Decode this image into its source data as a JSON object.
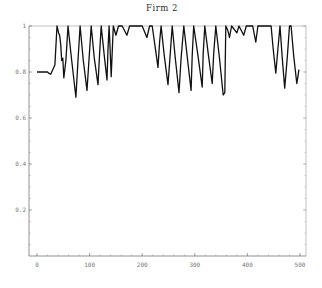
{
  "chart_data": {
    "type": "line",
    "title": "Firm 2",
    "xlabel": "",
    "ylabel": "",
    "xlim": [
      0,
      500
    ],
    "ylim": [
      0,
      1
    ],
    "x_ticks": [
      0,
      100,
      200,
      300,
      400,
      500
    ],
    "x_tick_labels": [
      "0",
      "100",
      "200",
      "300",
      "400",
      "500"
    ],
    "y_ticks": [
      0.2,
      0.4,
      0.6,
      0.8,
      1
    ],
    "y_tick_labels": [
      "0.2",
      "0.4",
      "0.6",
      "0.8",
      "1"
    ],
    "grid": false,
    "legend": null,
    "series": [
      {
        "name": "Firm 2",
        "color": "#111111",
        "x": [
          0,
          20,
          22,
          26,
          34,
          38,
          41,
          43,
          45,
          47,
          49,
          51,
          55,
          59,
          66,
          74,
          78,
          82,
          88,
          95,
          99,
          103,
          109,
          116,
          119,
          122,
          128,
          133,
          135,
          137,
          139,
          141,
          145,
          150,
          155,
          162,
          171,
          176,
          190,
          200,
          209,
          214,
          219,
          224,
          230,
          233,
          236,
          242,
          249,
          253,
          257,
          263,
          270,
          274,
          279,
          286,
          293,
          295,
          298,
          306,
          314,
          316,
          319,
          326,
          333,
          336,
          340,
          347,
          354,
          357,
          359,
          363,
          366,
          370,
          380,
          384,
          393,
          398,
          410,
          416,
          420,
          440,
          445,
          449,
          454,
          458,
          462,
          466,
          471,
          476,
          480,
          483,
          488,
          494,
          496,
          498
        ],
        "y": [
          0.8,
          0.8,
          0.795,
          0.79,
          0.83,
          1.0,
          0.97,
          0.96,
          0.92,
          0.85,
          0.86,
          0.775,
          0.85,
          1.0,
          0.85,
          0.69,
          0.85,
          1.0,
          0.85,
          0.72,
          0.86,
          1.0,
          0.86,
          0.745,
          0.88,
          1.0,
          0.87,
          0.765,
          0.9,
          1.0,
          0.9,
          0.78,
          1.0,
          0.96,
          1.0,
          1.0,
          0.96,
          1.0,
          1.0,
          1.0,
          0.95,
          1.0,
          1.0,
          0.92,
          0.82,
          0.93,
          1.0,
          0.87,
          0.745,
          0.87,
          1.0,
          0.86,
          0.71,
          0.86,
          1.0,
          0.86,
          0.72,
          0.87,
          1.0,
          0.87,
          0.735,
          0.88,
          1.0,
          0.87,
          0.75,
          0.88,
          1.0,
          0.86,
          0.7,
          0.71,
          1.0,
          0.98,
          0.95,
          1.0,
          0.97,
          1.0,
          0.96,
          1.0,
          1.0,
          0.93,
          1.0,
          1.0,
          1.0,
          0.9,
          0.795,
          0.9,
          1.0,
          0.87,
          0.73,
          0.87,
          1.0,
          1.0,
          0.87,
          0.75,
          0.78,
          0.81
        ]
      }
    ],
    "plot_area_px": {
      "left": 29,
      "right": 306,
      "top": 26,
      "bottom": 256
    },
    "data_to_px": {
      "x0_px": 37,
      "x500_px": 300,
      "y0_px": 256,
      "y1_px": 26
    }
  }
}
